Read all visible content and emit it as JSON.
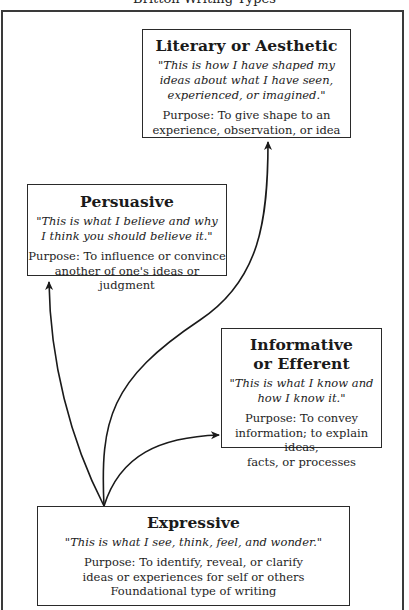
{
  "title": "Britton Writing Types",
  "boxes": {
    "literary": {
      "heading": "Literary or Aesthetic",
      "quote_lines": [
        "\"This is how I have shaped my",
        "ideas about what I have seen,",
        "experienced, or imagined.\""
      ],
      "purpose_lines": [
        "Purpose: To give shape to an",
        "experience, observation, or idea"
      ]
    },
    "persuasive": {
      "heading": "Persuasive",
      "quote_lines": [
        "\"This is what I believe and why",
        "I think you should believe it.\""
      ],
      "purpose_lines": [
        "Purpose: To influence or convince",
        "another of one's ideas or judgment"
      ]
    },
    "informative": {
      "heading_lines": [
        "Informative",
        "or Efferent"
      ],
      "quote_lines": [
        "\"This is what I know and",
        "how I know it.\""
      ],
      "purpose_lines": [
        "Purpose: To convey",
        "information; to explain ideas,",
        "facts, or processes"
      ]
    },
    "expressive": {
      "heading": "Expressive",
      "quote_lines": [
        "\"This is what I see, think, feel, and wonder.\""
      ],
      "purpose_lines": [
        "Purpose: To identify, reveal, or clarify",
        "ideas or experiences for self or others",
        "Foundational type of writing"
      ]
    }
  },
  "arrows": [
    {
      "from": "expressive",
      "to": "persuasive"
    },
    {
      "from": "expressive",
      "to": "literary"
    },
    {
      "from": "expressive",
      "to": "informative"
    }
  ],
  "colors": {
    "line": "#1a1a1a",
    "frame": "#3a3a3a",
    "background": "#ffffff"
  }
}
